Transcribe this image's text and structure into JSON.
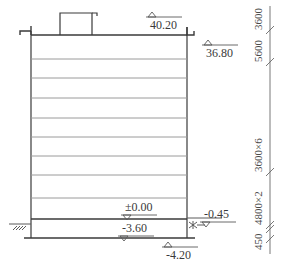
{
  "drawing": {
    "type": "building-elevation-section",
    "colors": {
      "line": "#3a3a3a",
      "floor_line": "#9a9a9a",
      "text": "#3a3a3a"
    },
    "elevations": [
      {
        "id": "penthouse-top",
        "label": "40.20",
        "x": 150,
        "y": 22,
        "marker": "up"
      },
      {
        "id": "roof",
        "label": "36.80",
        "x": 206,
        "y": 50,
        "marker": "up"
      },
      {
        "id": "ground-floor",
        "label": "±0.00",
        "x": 125,
        "y": 201,
        "marker": "down"
      },
      {
        "id": "outdoor-grade",
        "label": "-0.45",
        "x": 204,
        "y": 208,
        "marker": "down"
      },
      {
        "id": "basement-floor",
        "label": "-3.60",
        "x": 122,
        "y": 222,
        "marker": "down"
      },
      {
        "id": "foundation",
        "label": "-4.20",
        "x": 166,
        "y": 252,
        "marker": "up"
      }
    ],
    "dimensions": [
      {
        "id": "dim-penthouse",
        "label": "3600",
        "y_bottom": 30
      },
      {
        "id": "dim-top-floor",
        "label": "5600",
        "y_bottom": 62
      },
      {
        "id": "dim-typical",
        "label": "3600×6",
        "y_bottom": 172
      },
      {
        "id": "dim-lower",
        "label": "4800×2",
        "y_bottom": 225
      },
      {
        "id": "dim-basement",
        "label": "450",
        "y_bottom": 250
      }
    ],
    "floor_lines_y": [
      59,
      78,
      98,
      118,
      137,
      156,
      175,
      198
    ]
  }
}
